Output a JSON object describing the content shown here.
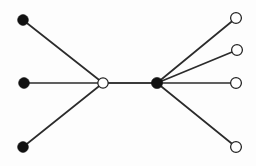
{
  "figure": {
    "width": 256,
    "height": 166,
    "background_color": "#fdfdfd"
  },
  "style": {
    "edge_color": "#2b2b2b",
    "spine_edge_color": "#3a3a3a",
    "edge_width": 1.7,
    "spine_edge_width": 2.1,
    "filled_node_fill": "#111111",
    "open_node_fill": "#ffffff",
    "open_node_stroke": "#222222",
    "open_node_stroke_width": 1.25,
    "node_radius": 5.4,
    "hub_open_radius": 5.2,
    "hub_filled_radius": 5.6
  },
  "chart_data": {
    "type": "graph",
    "node_count": 9,
    "edge_count": 8,
    "nodes": [
      {
        "id": "L1",
        "label": "",
        "x": 23,
        "y": 20,
        "fill": "filled",
        "role": "leaf"
      },
      {
        "id": "L2",
        "label": "",
        "x": 24,
        "y": 83,
        "fill": "filled",
        "role": "leaf"
      },
      {
        "id": "L3",
        "label": "",
        "x": 23,
        "y": 147,
        "fill": "filled",
        "role": "leaf"
      },
      {
        "id": "HL",
        "label": "",
        "x": 103,
        "y": 83,
        "fill": "open",
        "role": "hub"
      },
      {
        "id": "HR",
        "label": "",
        "x": 157,
        "y": 83,
        "fill": "filled",
        "role": "hub"
      },
      {
        "id": "R1",
        "label": "",
        "x": 236,
        "y": 18,
        "fill": "open",
        "role": "leaf"
      },
      {
        "id": "R2",
        "label": "",
        "x": 237,
        "y": 50,
        "fill": "open",
        "role": "leaf"
      },
      {
        "id": "R3",
        "label": "",
        "x": 236,
        "y": 83,
        "fill": "open",
        "role": "leaf"
      },
      {
        "id": "R4",
        "label": "",
        "x": 236,
        "y": 147,
        "fill": "open",
        "role": "leaf"
      }
    ],
    "edges": [
      {
        "source": "L1",
        "target": "HL",
        "kind": "normal"
      },
      {
        "source": "L2",
        "target": "HL",
        "kind": "normal"
      },
      {
        "source": "L3",
        "target": "HL",
        "kind": "normal"
      },
      {
        "source": "HL",
        "target": "HR",
        "kind": "spine"
      },
      {
        "source": "HR",
        "target": "R1",
        "kind": "normal"
      },
      {
        "source": "HR",
        "target": "R2",
        "kind": "normal"
      },
      {
        "source": "HR",
        "target": "R3",
        "kind": "normal"
      },
      {
        "source": "HR",
        "target": "R4",
        "kind": "normal"
      }
    ],
    "legend": [],
    "xlabel": "",
    "ylabel": "",
    "grid": false
  }
}
